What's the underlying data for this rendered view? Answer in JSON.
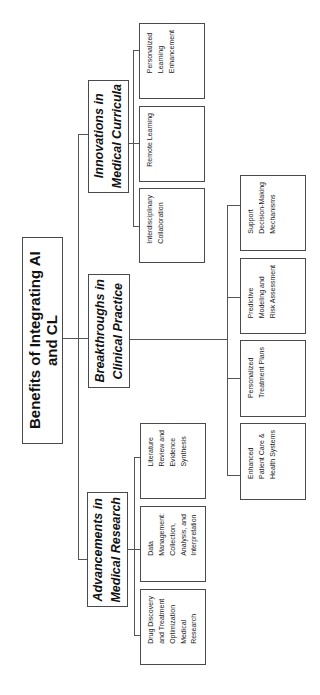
{
  "diagram": {
    "title": "Benefits of Integrating AI and CL",
    "branches": [
      {
        "label": "Innovations in\nMedical Curricula",
        "children": [
          {
            "label": "Personalized\nLearning\nEnhancement"
          },
          {
            "label": "Remote Learning"
          },
          {
            "label": "Interdisciplinary\nCollaboration"
          }
        ]
      },
      {
        "label": "Breakthroughs in\nClinical Practice",
        "children": [
          {
            "label": "Support\nDecision-Making\nMechanisms"
          },
          {
            "label": "Predictive\nModeling and\nRisk Assessment"
          },
          {
            "label": "Personalized\nTreatment Plans"
          },
          {
            "label": "Enhanced\nPatient Care &\nHealth Systems"
          }
        ]
      },
      {
        "label": "Advancements in\nMedical Research",
        "children": [
          {
            "label": "Literature\nReview and\nEvidence\nSynthesis"
          },
          {
            "label": "Data\nManagement:\nCollection,\nAnalysis, and\nInterpretation"
          },
          {
            "label": "Drug Discovery\nand Treatment\nOptimization\nMedical\nResearch"
          }
        ]
      }
    ],
    "colors": {
      "border": "#4a4a4a",
      "line": "#555555",
      "background": "#ffffff"
    }
  }
}
